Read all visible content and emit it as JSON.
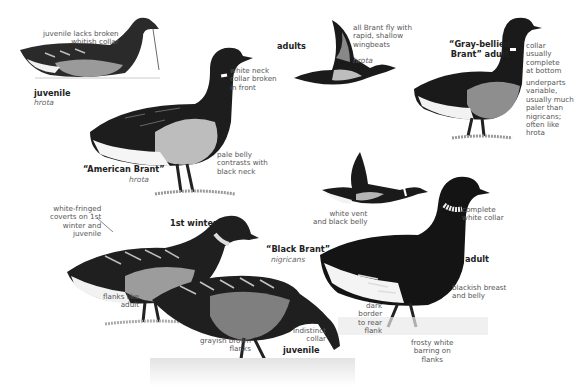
{
  "plate": {
    "subject": "Brant",
    "groups": {
      "adults": "adults"
    },
    "birds": [
      {
        "id": "juvenile-hrota",
        "title": "juvenile",
        "subspecies": "hrota",
        "notes": [
          "juvenile lacks broken\nwhitish collar"
        ]
      },
      {
        "id": "american-brant",
        "title": "“American Brant”",
        "subspecies": "hrota",
        "notes": [
          "white neck\ncollar broken\nin front",
          "pale belly\ncontrasts with\nblack neck"
        ]
      },
      {
        "id": "flying-hrota",
        "title": "",
        "subspecies": "hrota",
        "notes": [
          "all Brant fly with\nrapid, shallow\nwingbeats"
        ]
      },
      {
        "id": "gray-bellied",
        "title": "“Gray-bellied\nBrant” adult",
        "subspecies": "",
        "notes": [
          "collar\nusually\ncomplete\nat bottom",
          "underparts\nvariable,\nusually much\npaler than\nnigricans;\noften like\nhrota"
        ]
      },
      {
        "id": "flying-nigricans",
        "title": "",
        "subspecies": "",
        "notes": [
          "white vent\nand black belly"
        ]
      },
      {
        "id": "first-winter",
        "title": "1st winter",
        "subspecies": "",
        "notes": [
          "white-fringed\ncoverts on 1st\nwinter and\njuvenile",
          "flanks like\nadult"
        ]
      },
      {
        "id": "black-brant",
        "title": "“Black Brant”",
        "subspecies": "nigricans",
        "notes": []
      },
      {
        "id": "black-brant-adult",
        "title": "adult",
        "subspecies": "",
        "notes": [
          "complete\nwhite collar",
          "blackish breast\nand belly",
          "dark\nborder\nto rear\nflank",
          "frosty white\nbarring on\nflanks"
        ]
      },
      {
        "id": "black-brant-juvenile",
        "title": "juvenile",
        "subspecies": "",
        "notes": [
          "indistinct\ncollar",
          "grayish brown\nflanks"
        ]
      }
    ]
  },
  "colors": {
    "ink": "#111111",
    "gray": "#8a8a8a",
    "pale": "#c9c9c9",
    "text": "#555555"
  }
}
